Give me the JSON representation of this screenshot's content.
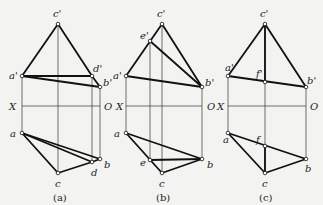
{
  "figure": {
    "axis_labels": {
      "x": "X",
      "o": "O"
    },
    "panels": [
      {
        "id": "a",
        "caption": "(a)",
        "axis": {
          "x1": 22,
          "x2": 100,
          "y": 106,
          "x_label_x": 9,
          "o_label_x": 104
        },
        "points": {
          "c'": [
            58,
            24
          ],
          "a'": [
            22,
            76
          ],
          "d'": [
            92,
            76
          ],
          "b'": [
            100,
            87
          ],
          "a": [
            22,
            133
          ],
          "c": [
            58,
            173
          ],
          "d": [
            92,
            162
          ],
          "b": [
            100,
            159
          ]
        },
        "labels": [
          {
            "text": "c'",
            "x": 53,
            "y": 17
          },
          {
            "text": "a'",
            "x": 9,
            "y": 79
          },
          {
            "text": "d'",
            "x": 93,
            "y": 72
          },
          {
            "text": "b'",
            "x": 103,
            "y": 86
          },
          {
            "text": "a",
            "x": 10,
            "y": 137
          },
          {
            "text": "d",
            "x": 91,
            "y": 176
          },
          {
            "text": "b",
            "x": 104,
            "y": 168
          },
          {
            "text": "c",
            "x": 55,
            "y": 187
          }
        ],
        "thick_lines": [
          [
            "c'",
            "a'"
          ],
          [
            "c'",
            "d'"
          ],
          [
            "a'",
            "d'"
          ],
          [
            "a'",
            "b'"
          ],
          [
            "d'",
            "b'"
          ],
          [
            "a",
            "c"
          ],
          [
            "c",
            "d"
          ],
          [
            "a",
            "d"
          ],
          [
            "a",
            "b"
          ],
          [
            "d",
            "b"
          ]
        ],
        "projectors": [
          [
            "a'",
            "a"
          ],
          [
            "c'",
            "c"
          ],
          [
            "d'",
            "d"
          ],
          [
            "b'",
            "b"
          ]
        ]
      },
      {
        "id": "b",
        "caption": "(b)",
        "axis": {
          "x1": 126,
          "x2": 202,
          "y": 106,
          "x_label_x": 116,
          "o_label_x": 207
        },
        "points": {
          "c'": [
            162,
            24
          ],
          "e'": [
            150,
            41
          ],
          "a'": [
            126,
            76
          ],
          "b'": [
            202,
            87
          ],
          "a": [
            126,
            133
          ],
          "e": [
            150,
            160
          ],
          "c": [
            162,
            173
          ],
          "b": [
            202,
            159
          ]
        },
        "labels": [
          {
            "text": "c'",
            "x": 157,
            "y": 17
          },
          {
            "text": "e'",
            "x": 140,
            "y": 39
          },
          {
            "text": "a'",
            "x": 113,
            "y": 79
          },
          {
            "text": "b'",
            "x": 205,
            "y": 86
          },
          {
            "text": "a",
            "x": 114,
            "y": 137
          },
          {
            "text": "e",
            "x": 140,
            "y": 166
          },
          {
            "text": "b",
            "x": 207,
            "y": 168
          },
          {
            "text": "c",
            "x": 159,
            "y": 187
          }
        ],
        "thick_lines": [
          [
            "c'",
            "a'"
          ],
          [
            "c'",
            "b'"
          ],
          [
            "a'",
            "b'"
          ],
          [
            "e'",
            "b'"
          ],
          [
            "a",
            "b"
          ],
          [
            "a",
            "c"
          ],
          [
            "c",
            "b"
          ],
          [
            "e",
            "b"
          ]
        ],
        "projectors": [
          [
            "a'",
            "a"
          ],
          [
            "e'",
            "e"
          ],
          [
            "c'",
            "c"
          ],
          [
            "b'",
            "b"
          ]
        ]
      },
      {
        "id": "c",
        "caption": "(c)",
        "axis": {
          "x1": 228,
          "x2": 306,
          "y": 106,
          "x_label_x": 217,
          "o_label_x": 310
        },
        "points": {
          "c'": [
            265,
            24
          ],
          "a'": [
            228,
            76
          ],
          "f'": [
            265,
            82
          ],
          "b'": [
            306,
            87
          ],
          "a": [
            228,
            133
          ],
          "f": [
            265,
            146
          ],
          "c": [
            265,
            173
          ],
          "b": [
            306,
            159
          ]
        },
        "labels": [
          {
            "text": "c'",
            "x": 260,
            "y": 17
          },
          {
            "text": "a'",
            "x": 225,
            "y": 71
          },
          {
            "text": "f'",
            "x": 256,
            "y": 77
          },
          {
            "text": "b'",
            "x": 307,
            "y": 84
          },
          {
            "text": "a",
            "x": 223,
            "y": 143
          },
          {
            "text": "f",
            "x": 256,
            "y": 143
          },
          {
            "text": "b",
            "x": 305,
            "y": 172
          },
          {
            "text": "c",
            "x": 262,
            "y": 187
          }
        ],
        "thick_lines": [
          [
            "c'",
            "a'"
          ],
          [
            "c'",
            "b'"
          ],
          [
            "a'",
            "b'"
          ],
          [
            "c'",
            "f'"
          ],
          [
            "a",
            "b"
          ],
          [
            "a",
            "c"
          ],
          [
            "c",
            "b"
          ],
          [
            "f",
            "c"
          ]
        ],
        "projectors": [
          [
            "a'",
            "a"
          ],
          [
            "c'",
            "c"
          ],
          [
            "b'",
            "b"
          ]
        ]
      }
    ]
  }
}
